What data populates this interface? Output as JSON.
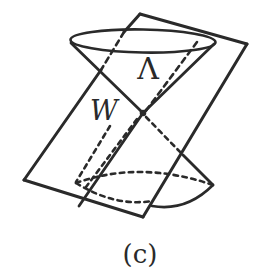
{
  "figure": {
    "labels": {
      "upper_cone": "Λ",
      "apex": "W"
    },
    "caption": "(c)",
    "colors": {
      "ink": "#2a2a2a",
      "background": "#ffffff"
    }
  }
}
